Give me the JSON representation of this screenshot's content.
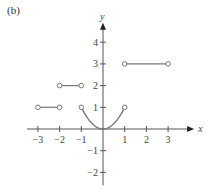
{
  "panel_label": "(b)",
  "chart_data": {
    "type": "line",
    "title": "",
    "xlabel": "x",
    "ylabel": "y",
    "xlim": [
      -3.5,
      4.2
    ],
    "ylim": [
      -2.6,
      4.9
    ],
    "x_ticks": [
      -3,
      -2,
      -1,
      1,
      2,
      3
    ],
    "y_ticks": [
      -2,
      -1,
      1,
      2,
      3,
      4
    ],
    "grid": false,
    "series": [
      {
        "name": "segment",
        "kind": "horizontal",
        "x": [
          -3,
          -2
        ],
        "y": [
          1,
          1
        ],
        "endpoints": [
          "open",
          "open"
        ]
      },
      {
        "name": "segment",
        "kind": "horizontal",
        "x": [
          -2,
          -1
        ],
        "y": [
          2,
          2
        ],
        "endpoints": [
          "open",
          "open"
        ]
      },
      {
        "name": "parabola",
        "kind": "y=x^2",
        "x": [
          -1,
          1
        ],
        "y": [
          1,
          1
        ],
        "endpoints": [
          "open",
          "open"
        ]
      },
      {
        "name": "segment",
        "kind": "horizontal",
        "x": [
          1,
          3
        ],
        "y": [
          3,
          3
        ],
        "endpoints": [
          "open",
          "open"
        ]
      }
    ]
  },
  "colors": {
    "axis": "#555555",
    "curve": "#777777",
    "text": "#444444"
  }
}
